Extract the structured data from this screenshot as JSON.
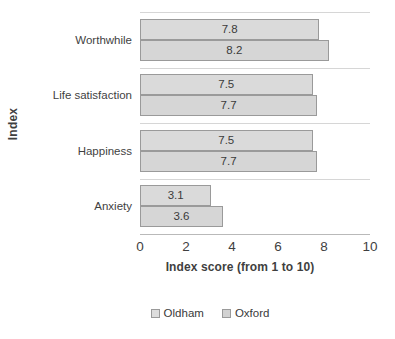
{
  "chart_data": {
    "type": "bar",
    "orientation": "horizontal",
    "grouping": "grouped",
    "title": "",
    "subtitle": "",
    "xlabel": "Index score (from 1 to 10)",
    "ylabel": "Index",
    "xlim": [
      0,
      10
    ],
    "xticks": [
      0,
      2,
      4,
      6,
      8,
      10
    ],
    "xtick_labels": [
      "0",
      "2",
      "4",
      "6",
      "8",
      "10"
    ],
    "grid": "x-category-separators",
    "legend_position": "bottom-center",
    "categories": [
      "Worthwhile",
      "Life satisfaction",
      "Happiness",
      "Anxiety"
    ],
    "series": [
      {
        "name": "Oldham",
        "color": "#dadada",
        "border_color": "#9a9a9a",
        "values": [
          7.8,
          7.5,
          7.5,
          3.1
        ],
        "value_labels": [
          "7.8",
          "7.5",
          "7.5",
          "3.1"
        ]
      },
      {
        "name": "Oxford",
        "color": "#d6d6d6",
        "border_color": "#9a9a9a",
        "values": [
          8.2,
          7.7,
          7.7,
          3.6
        ],
        "value_labels": [
          "8.2",
          "7.7",
          "7.7",
          "3.6"
        ]
      }
    ]
  },
  "legend": {
    "entries": [
      {
        "label": "Oldham",
        "swatch_class": "series-oldham"
      },
      {
        "label": "Oxford",
        "swatch_class": "series-oxford"
      }
    ]
  },
  "colors": {
    "background": "#ffffff",
    "text": "#3f3f3f",
    "gridline": "#d6d6d6",
    "axis_line": "#b9b9b9",
    "series_oldham_fill": "#dadada",
    "series_oxford_fill": "#d6d6d6",
    "bar_border": "#9a9a9a"
  }
}
